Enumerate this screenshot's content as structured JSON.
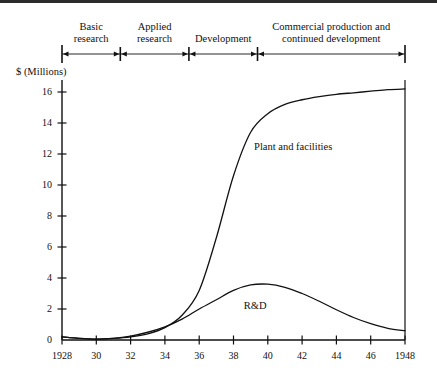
{
  "figure": {
    "background": "#ffffff",
    "ink": "#111111",
    "topbar_color": "#2b2b2b"
  },
  "phases": [
    {
      "label": "Basic\nresearch",
      "start_year": 1928,
      "end_year": 1931.4
    },
    {
      "label": "Applied\nresearch",
      "start_year": 1931.4,
      "end_year": 1935.4
    },
    {
      "label": "Development",
      "start_year": 1935.4,
      "end_year": 1939.4
    },
    {
      "label": "Commercial production and\ncontinued development",
      "start_year": 1939.4,
      "end_year": 1948
    }
  ],
  "chart_data": {
    "type": "line",
    "title": "",
    "subtitle": "",
    "xlabel": "",
    "ylabel": "$ (Millions)",
    "xlim": [
      1928,
      1948
    ],
    "ylim": [
      0,
      17
    ],
    "grid": false,
    "legend_position": "inline-annotation",
    "xticks": [
      1928,
      1930,
      1932,
      1934,
      1936,
      1938,
      1940,
      1942,
      1944,
      1946,
      1948
    ],
    "xtick_labels": [
      "1928",
      "30",
      "32",
      "34",
      "36",
      "38",
      "40",
      "42",
      "44",
      "46",
      "1948"
    ],
    "yticks": [
      0,
      2,
      4,
      6,
      8,
      10,
      12,
      14,
      16
    ],
    "ytick_labels": [
      "0",
      "2",
      "4",
      "6",
      "8",
      "10",
      "12",
      "14",
      "16"
    ],
    "x": [
      1928,
      1929,
      1930,
      1931,
      1932,
      1933,
      1934,
      1935,
      1936,
      1937,
      1938,
      1939,
      1940,
      1941,
      1942,
      1943,
      1944,
      1945,
      1946,
      1947,
      1948
    ],
    "series": [
      {
        "name": "Plant and facilities",
        "label": "Plant and facilities",
        "label_x": 1939.2,
        "label_y": 12.4,
        "color": "#111111",
        "values": [
          0.2,
          0.1,
          0.05,
          0.1,
          0.2,
          0.4,
          0.8,
          1.6,
          3.2,
          6.6,
          10.6,
          13.4,
          14.6,
          15.2,
          15.5,
          15.7,
          15.85,
          15.95,
          16.05,
          16.15,
          16.2
        ]
      },
      {
        "name": "R&D",
        "label": "R&D",
        "label_x": 1938.6,
        "label_y": 2.1,
        "color": "#111111",
        "values": [
          0.2,
          0.1,
          0.05,
          0.1,
          0.25,
          0.5,
          0.85,
          1.35,
          2.0,
          2.6,
          3.2,
          3.55,
          3.6,
          3.4,
          3.0,
          2.5,
          1.95,
          1.45,
          1.05,
          0.75,
          0.6
        ]
      }
    ],
    "annotations": [
      {
        "text": "Plant and facilities",
        "x": 1939.2,
        "y": 12.4
      },
      {
        "text": "R&D",
        "x": 1938.6,
        "y": 2.1
      }
    ]
  }
}
